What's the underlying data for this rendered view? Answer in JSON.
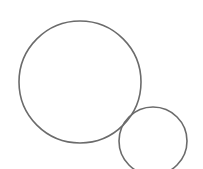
{
  "canvas": {
    "width": 203,
    "height": 169,
    "background": "#ffffff"
  },
  "shapes": [
    {
      "name": "large-circle",
      "type": "circle",
      "cx": 80,
      "cy": 82,
      "r": 61,
      "stroke": "#6b6b6b",
      "stroke_width": 1.6,
      "fill": "none"
    },
    {
      "name": "small-circle",
      "type": "circle",
      "cx": 153,
      "cy": 141,
      "r": 34,
      "stroke": "#6b6b6b",
      "stroke_width": 1.6,
      "fill": "none"
    }
  ]
}
